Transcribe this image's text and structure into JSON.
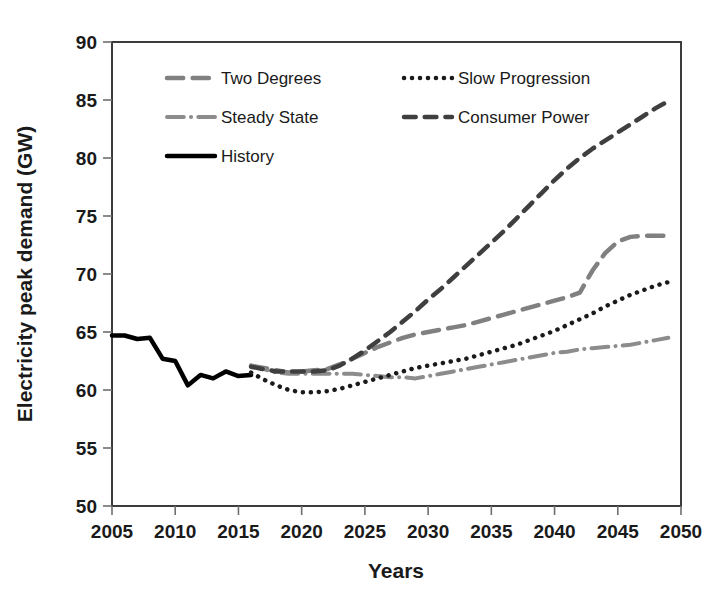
{
  "chart_data": {
    "type": "line",
    "title": "",
    "xlabel": "Years",
    "ylabel": "Electricity peak demand (GW)",
    "xlim": [
      2005,
      2050
    ],
    "ylim": [
      50,
      90
    ],
    "xticks": [
      2005,
      2010,
      2015,
      2020,
      2025,
      2030,
      2035,
      2040,
      2045,
      2050
    ],
    "yticks": [
      50,
      55,
      60,
      65,
      70,
      75,
      80,
      85,
      90
    ],
    "grid": false,
    "legend_position": "top-left-inside",
    "series": [
      {
        "name": "Two Degrees",
        "style": "long-dash",
        "color": "#808080",
        "width": 4.5,
        "x": [
          2016,
          2017,
          2018,
          2019,
          2020,
          2021,
          2022,
          2023,
          2024,
          2025,
          2026,
          2027,
          2028,
          2029,
          2030,
          2031,
          2032,
          2033,
          2034,
          2035,
          2036,
          2037,
          2038,
          2039,
          2040,
          2041,
          2042,
          2043,
          2044,
          2045,
          2046,
          2047,
          2048,
          2049
        ],
        "y": [
          62.1,
          61.9,
          61.7,
          61.5,
          61.6,
          61.7,
          61.8,
          62.2,
          62.7,
          63.2,
          63.7,
          64.1,
          64.5,
          64.8,
          65.0,
          65.2,
          65.4,
          65.6,
          65.9,
          66.2,
          66.5,
          66.8,
          67.1,
          67.4,
          67.7,
          68.0,
          68.4,
          70.3,
          71.8,
          72.8,
          73.2,
          73.3,
          73.3,
          73.3
        ]
      },
      {
        "name": "Steady State",
        "style": "dash-dot",
        "color": "#8c8c8c",
        "width": 4.0,
        "x": [
          2016,
          2017,
          2018,
          2019,
          2020,
          2021,
          2022,
          2023,
          2024,
          2025,
          2026,
          2027,
          2028,
          2029,
          2030,
          2031,
          2032,
          2033,
          2034,
          2035,
          2036,
          2037,
          2038,
          2039,
          2040,
          2041,
          2042,
          2043,
          2044,
          2045,
          2046,
          2047,
          2048,
          2049
        ],
        "y": [
          62.1,
          61.8,
          61.5,
          61.4,
          61.4,
          61.4,
          61.4,
          61.4,
          61.4,
          61.3,
          61.2,
          61.1,
          61.1,
          61.0,
          61.2,
          61.4,
          61.6,
          61.8,
          62.0,
          62.2,
          62.4,
          62.6,
          62.8,
          63.0,
          63.2,
          63.3,
          63.5,
          63.6,
          63.7,
          63.8,
          63.9,
          64.1,
          64.3,
          64.5
        ]
      },
      {
        "name": "History",
        "style": "solid",
        "color": "#000000",
        "width": 4.5,
        "x": [
          2005,
          2006,
          2007,
          2008,
          2009,
          2010,
          2011,
          2012,
          2013,
          2014,
          2015,
          2016
        ],
        "y": [
          64.7,
          64.7,
          64.4,
          64.5,
          62.7,
          62.5,
          60.4,
          61.3,
          61.0,
          61.6,
          61.2,
          61.3
        ]
      },
      {
        "name": "Slow Progression",
        "style": "dotted",
        "color": "#1a1a1a",
        "width": 4.5,
        "x": [
          2016,
          2017,
          2018,
          2019,
          2020,
          2021,
          2022,
          2023,
          2024,
          2025,
          2026,
          2027,
          2028,
          2029,
          2030,
          2031,
          2032,
          2033,
          2034,
          2035,
          2036,
          2037,
          2038,
          2039,
          2040,
          2041,
          2042,
          2043,
          2044,
          2045,
          2046,
          2047,
          2048,
          2049
        ],
        "y": [
          61.5,
          60.9,
          60.4,
          60.0,
          59.8,
          59.8,
          59.9,
          60.1,
          60.4,
          60.7,
          61.0,
          61.3,
          61.6,
          61.9,
          62.1,
          62.3,
          62.5,
          62.7,
          63.0,
          63.3,
          63.6,
          63.9,
          64.3,
          64.7,
          65.1,
          65.6,
          66.1,
          66.6,
          67.2,
          67.7,
          68.2,
          68.6,
          69.0,
          69.3
        ]
      },
      {
        "name": "Consumer Power",
        "style": "dash",
        "color": "#3f3f3f",
        "width": 4.5,
        "x": [
          2016,
          2017,
          2018,
          2019,
          2020,
          2021,
          2022,
          2023,
          2024,
          2025,
          2026,
          2027,
          2028,
          2029,
          2030,
          2031,
          2032,
          2033,
          2034,
          2035,
          2036,
          2037,
          2038,
          2039,
          2040,
          2041,
          2042,
          2043,
          2044,
          2045,
          2046,
          2047,
          2048,
          2049
        ],
        "y": [
          62.0,
          61.8,
          61.6,
          61.6,
          61.6,
          61.6,
          61.7,
          62.1,
          62.7,
          63.4,
          64.2,
          65.0,
          65.9,
          66.8,
          67.8,
          68.7,
          69.7,
          70.7,
          71.7,
          72.7,
          73.7,
          74.8,
          75.9,
          77.0,
          78.1,
          79.1,
          80.0,
          80.8,
          81.5,
          82.2,
          82.9,
          83.6,
          84.3,
          84.9
        ]
      }
    ],
    "legend": [
      {
        "label": "Two Degrees",
        "style": "long-dash",
        "color": "#808080"
      },
      {
        "label": "Slow Progression",
        "style": "dotted",
        "color": "#1a1a1a"
      },
      {
        "label": "Steady State",
        "style": "dash-dot",
        "color": "#8c8c8c"
      },
      {
        "label": "Consumer Power",
        "style": "dash",
        "color": "#3f3f3f"
      },
      {
        "label": "History",
        "style": "solid",
        "color": "#000000"
      }
    ]
  }
}
